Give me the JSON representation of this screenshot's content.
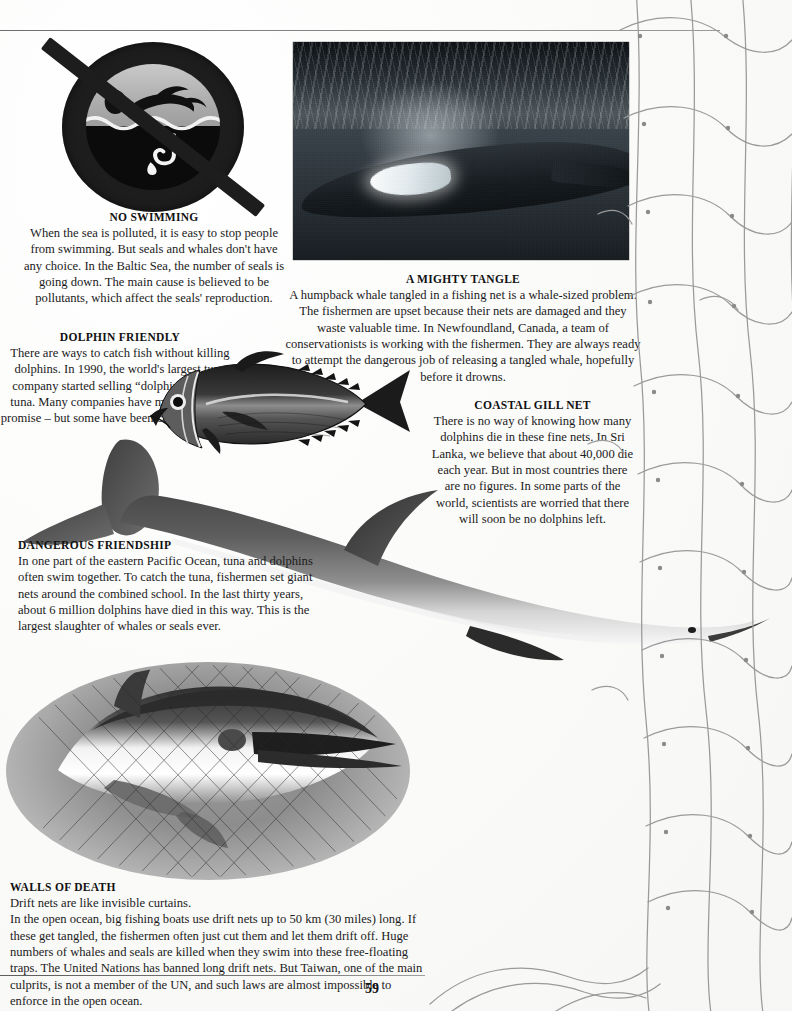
{
  "page": {
    "number": "59",
    "background_color": "#fdfdfc",
    "ink_color": "#1a1a1a"
  },
  "sections": [
    {
      "id": "no-swimming",
      "heading": "NO SWIMMING",
      "align": "center",
      "body": "When the sea is polluted, it is easy to stop people from swimming. But seals and whales don't have any choice. In the Baltic Sea, the number of seals is going down. The main cause is believed to be pollutants, which affect the seals' reproduction."
    },
    {
      "id": "mighty-tangle",
      "heading": "A MIGHTY TANGLE",
      "align": "center",
      "body": "A humpback whale tangled in a fishing net is a whale-sized problem. The fishermen are upset because their nets are damaged and they waste valuable time. In Newfoundland, Canada, a team of conservationists is working with the fishermen. They are always ready to attempt the dangerous job of releasing a tangled whale, hopefully before it drowns."
    },
    {
      "id": "dolphin-friendly",
      "heading": "DOLPHIN FRIENDLY",
      "align": "center",
      "body": "There are ways to catch fish without killing dolphins. In 1990, the world's largest tuna company started selling “dolphin friendly” tuna. Many companies have made the same promise – but some have been caught cheating."
    },
    {
      "id": "coastal-gill-net",
      "heading": "COASTAL GILL NET",
      "align": "center",
      "body": "There is no way of knowing how many dolphins die in these fine nets. In Sri Lanka, we believe that about 40,000 die each year. But in most countries there are no figures. In some parts of the world, scientists are worried that there will soon be no dolphins left."
    },
    {
      "id": "dangerous-friendship",
      "heading": "DANGEROUS FRIENDSHIP",
      "align": "left",
      "body": "In one part of the eastern Pacific Ocean, tuna and dolphins often  swim together. To catch the tuna, fishermen set giant nets around the combined school. In the last thirty years, about 6 million dolphins have died in this way. This is the largest slaughter of whales or seals ever."
    },
    {
      "id": "walls-of-death",
      "heading": "WALLS OF DEATH",
      "align": "left",
      "body": "Drift nets are like invisible curtains.\nIn the open ocean, big fishing boats use drift nets up to 50 km (30 miles) long. If these get tangled, the fishermen often just cut them and let them drift off. Huge numbers of whales and seals are killed when they swim into these free-floating traps. The United Nations has banned long drift nets. But Taiwan, one of the main culprits, is not a member of the UN, and such laws are almost impossible to enforce in the open ocean."
    }
  ],
  "figures": [
    {
      "id": "no-swimming-sign",
      "kind": "pictogram",
      "caption": "no-swimming prohibition sign with swimmer, waves and fishing hook"
    },
    {
      "id": "humpback-photo",
      "kind": "photograph",
      "caption": "underwater photograph of a humpback whale with a white pectoral fin"
    },
    {
      "id": "tuna-illustration",
      "kind": "engraving",
      "caption": "tuna fish engraving facing left"
    },
    {
      "id": "dolphin-illustration",
      "kind": "illustration",
      "caption": "large dolphin swimming diagonally across the page"
    },
    {
      "id": "netted-dolphin-photo",
      "kind": "photograph",
      "caption": "oval vignette photograph of a dolphin caught in a fishing net"
    },
    {
      "id": "drift-net",
      "kind": "illustration",
      "caption": "fishing net mesh draped over the right-hand side of the page"
    }
  ]
}
